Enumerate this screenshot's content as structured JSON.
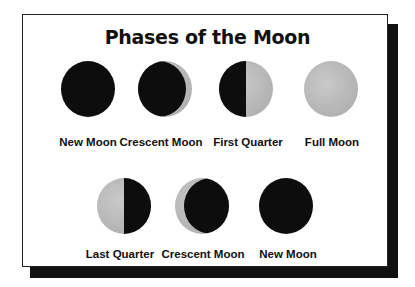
{
  "title": "Phases of the Moon",
  "colors": {
    "dark": "#0d0d0d",
    "lit": "#bdbdbd",
    "shadow": "#111111"
  },
  "row1": [
    {
      "label": "New Moon",
      "phase": "new"
    },
    {
      "label": "Crescent Moon",
      "phase": "waxing-crescent"
    },
    {
      "label": "First Quarter",
      "phase": "first-quarter"
    },
    {
      "label": "Full Moon",
      "phase": "full"
    }
  ],
  "row2": [
    {
      "label": "Last Quarter",
      "phase": "last-quarter"
    },
    {
      "label": "Crescent Moon",
      "phase": "waning-crescent"
    },
    {
      "label": "New Moon",
      "phase": "new"
    }
  ]
}
